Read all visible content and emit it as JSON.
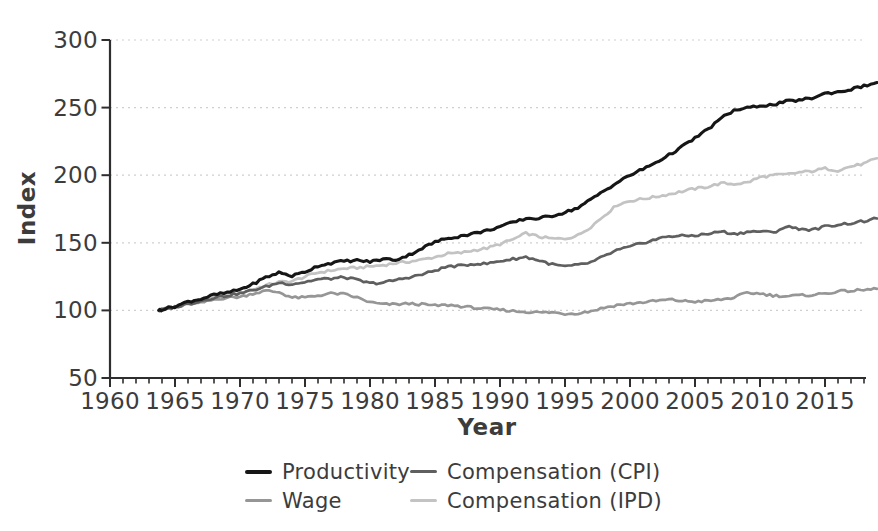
{
  "figure": {
    "background": "#ffffff",
    "text_color": "#3c3c3c",
    "axis_color": "#2e2e2e",
    "gridline_color": "#cfcfcf"
  },
  "axes": {
    "x": {
      "label": "Year",
      "major_ticks": [
        1960,
        1965,
        1970,
        1975,
        1980,
        1985,
        1990,
        1995,
        2000,
        2005,
        2010,
        2015
      ],
      "minor_tick_interval": 1,
      "minor_tick_end": 2018
    },
    "y": {
      "label": "Index",
      "ticks": [
        50,
        100,
        150,
        200,
        250,
        300
      ],
      "gridline_ticks": [
        100,
        150,
        200,
        250,
        300
      ]
    }
  },
  "legend": {
    "position": "bottom",
    "columns": 2
  },
  "chart_data": {
    "type": "line",
    "title": "",
    "xlabel": "Year",
    "ylabel": "Index",
    "xlim": [
      1960,
      2019
    ],
    "ylim": [
      50,
      300
    ],
    "grid": "horizontal-dashed",
    "legend_position": "bottom",
    "texture": {
      "subdivisions": 4,
      "jitter_amplitude": 0.9
    },
    "x": [
      1963.75,
      1964,
      1965,
      1966,
      1967,
      1968,
      1969,
      1970,
      1971,
      1972,
      1973,
      1974,
      1975,
      1976,
      1977,
      1978,
      1979,
      1980,
      1981,
      1982,
      1983,
      1984,
      1985,
      1986,
      1987,
      1988,
      1989,
      1990,
      1991,
      1992,
      1993,
      1994,
      1995,
      1996,
      1997,
      1998,
      1999,
      2000,
      2001,
      2002,
      2003,
      2004,
      2005,
      2006,
      2007,
      2008,
      2009,
      2010,
      2011,
      2012,
      2013,
      2014,
      2015,
      2016,
      2017,
      2018,
      2019
    ],
    "series": [
      {
        "name": "Productivity",
        "color": "#161616",
        "stroke_width": 3.1,
        "z": 4,
        "values": [
          100,
          100.7,
          103,
          106.5,
          108.5,
          111.5,
          113,
          115.5,
          119.5,
          124.5,
          128,
          125.5,
          128.5,
          133,
          135,
          136.5,
          137,
          136,
          138,
          137.5,
          141,
          146,
          150.5,
          153.5,
          155,
          157,
          159,
          162,
          165,
          168,
          168,
          170,
          172.5,
          176,
          182,
          188.5,
          194.5,
          200,
          204.5,
          209.5,
          215,
          221,
          227.5,
          234,
          242,
          248,
          249.5,
          251.5,
          252,
          254.5,
          255.5,
          257,
          260.5,
          261.5,
          263.5,
          266,
          268.5
        ]
      },
      {
        "name": "Compensation (CPI)",
        "color": "#5f5f5f",
        "stroke_width": 2.7,
        "z": 3,
        "values": [
          100,
          100.5,
          102.5,
          105,
          107,
          109.5,
          111,
          112.5,
          115,
          117.5,
          120.5,
          119.5,
          121,
          123,
          123.5,
          124.5,
          122.5,
          120,
          120.5,
          122.5,
          124.5,
          126.5,
          129.5,
          132.5,
          133,
          134.5,
          134.5,
          136.5,
          138,
          139.5,
          137,
          134,
          132.5,
          133.5,
          135.5,
          140,
          144.5,
          147,
          150,
          152.5,
          155,
          155,
          155.5,
          156.5,
          158.5,
          156.5,
          158,
          158.5,
          157.5,
          162,
          160.5,
          159.5,
          162,
          163.5,
          164.5,
          166,
          168
        ]
      },
      {
        "name": "Wage",
        "color": "#969696",
        "stroke_width": 2.7,
        "z": 2,
        "values": [
          100,
          100.5,
          102,
          104.5,
          105.5,
          108,
          109.5,
          110,
          112.5,
          114.5,
          113.5,
          109.5,
          109.5,
          111,
          112.5,
          112,
          109.5,
          106,
          104.5,
          104.5,
          105,
          104.5,
          103.5,
          104,
          103,
          102,
          101,
          100.5,
          99.5,
          99,
          98.5,
          98.5,
          97.5,
          98,
          99.5,
          102,
          104,
          105,
          106,
          107,
          108,
          107,
          106.5,
          107,
          108,
          109.5,
          113,
          112.5,
          111,
          110.5,
          111,
          111.5,
          112.5,
          114,
          114.5,
          115,
          116
        ]
      },
      {
        "name": "Compensation (IPD)",
        "color": "#c3c3c3",
        "stroke_width": 2.7,
        "z": 1,
        "values": [
          100,
          100.5,
          102.5,
          105.5,
          107.5,
          110,
          111.5,
          113,
          115.5,
          118.5,
          121,
          121.5,
          125,
          128,
          129.5,
          131,
          131.5,
          132.5,
          133.5,
          135,
          136,
          137.5,
          139.5,
          142,
          142.5,
          144.5,
          146,
          149,
          152.5,
          157,
          154.5,
          153,
          153,
          155.5,
          162,
          170,
          178,
          181,
          182.5,
          184,
          186,
          188,
          190,
          191.5,
          194,
          193.5,
          194.5,
          198.5,
          200,
          200.5,
          202,
          203,
          205,
          203.5,
          206.5,
          208.5,
          212.5
        ]
      }
    ]
  }
}
